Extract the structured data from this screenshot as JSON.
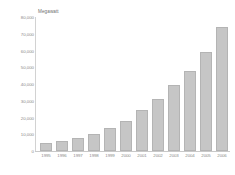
{
  "chart_data": {
    "type": "bar",
    "title": "",
    "unit_label": "Megawatt",
    "xlabel": "",
    "ylabel": "Megawatt",
    "categories": [
      "1995",
      "1996",
      "1997",
      "1998",
      "1999",
      "2000",
      "2001",
      "2002",
      "2003",
      "2004",
      "2005",
      "2006"
    ],
    "values": [
      4800,
      6100,
      7600,
      10200,
      13600,
      18000,
      24300,
      31100,
      39400,
      47600,
      59000,
      74000
    ],
    "ylim": [
      0,
      80000
    ],
    "yticks": [
      0,
      10000,
      20000,
      30000,
      40000,
      50000,
      60000,
      70000,
      80000
    ],
    "ytick_labels": [
      "0",
      "10,000",
      "20,000",
      "30,000",
      "40,000",
      "50,000",
      "60,000",
      "70,000",
      "80,000"
    ],
    "grid": false,
    "legend": null,
    "series": [
      {
        "name": "Megawatt",
        "values": [
          4800,
          6100,
          7600,
          10200,
          13600,
          18000,
          24300,
          31100,
          39400,
          47600,
          59000,
          74000
        ]
      }
    ],
    "colors": {
      "bar_fill": "#c6c6c6",
      "bar_edge": "#b4b4b4",
      "axis": "#c9c9c9",
      "tick_text": "#8a8a8a",
      "label_text": "#6e6e6e",
      "background": "#ffffff"
    }
  }
}
